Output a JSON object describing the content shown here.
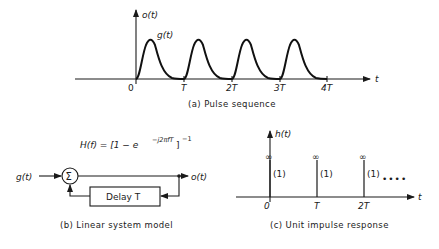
{
  "panel_a": {
    "caption": "(a)  Pulse sequence",
    "y_label": "o(t)",
    "curve_label": "g(t)",
    "x_axis_label": "t",
    "ticks": [
      {
        "label": "0",
        "x": 136
      },
      {
        "label": "T",
        "x": 184
      },
      {
        "label": "2T",
        "x": 232
      },
      {
        "label": "3T",
        "x": 280
      },
      {
        "label": "4T",
        "x": 327
      }
    ],
    "pulse_count": 4
  },
  "panel_b": {
    "caption": "(b)  Linear system model",
    "formula_main": "H(f) = [1 − e",
    "formula_exp": "−j2πfT",
    "formula_close": "]",
    "formula_power": "−1",
    "input_label": "g(t)",
    "summer_symbol": "Σ",
    "delay_label": "Delay  T",
    "output_label": "o(t)"
  },
  "panel_c": {
    "caption": "(c)  Unit impulse response",
    "y_label": "h(t)",
    "x_axis_label": "t",
    "impulses": [
      {
        "tick": "0",
        "top": "∞",
        "weight": "(1)"
      },
      {
        "tick": "T",
        "top": "∞",
        "weight": "(1)"
      },
      {
        "tick": "2T",
        "top": "∞",
        "weight": "(1)"
      }
    ],
    "continuation": "••••"
  }
}
